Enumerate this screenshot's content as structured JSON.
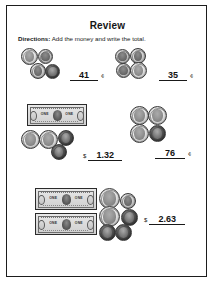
{
  "worksheet": {
    "title": "Review",
    "directions_label": "Directions:",
    "directions_text": " Add the money and write the total."
  },
  "problems": [
    {
      "id": "problem-1",
      "position": "row1-left",
      "currency_symbol": "",
      "answer": "41",
      "unit": "¢",
      "bills": 0,
      "coins": 4
    },
    {
      "id": "problem-2",
      "position": "row1-right",
      "currency_symbol": "",
      "answer": "35",
      "unit": "¢",
      "bills": 0,
      "coins": 4
    },
    {
      "id": "problem-3",
      "position": "row2-left",
      "currency_symbol": "$",
      "answer": "1.32",
      "unit": "",
      "bills": 1,
      "coins": 4
    },
    {
      "id": "problem-4",
      "position": "row2-right",
      "currency_symbol": "",
      "answer": "76",
      "unit": "¢",
      "bills": 0,
      "coins": 4
    },
    {
      "id": "problem-5",
      "position": "row3",
      "currency_symbol": "$",
      "answer": "2.63",
      "unit": "",
      "bills": 2,
      "coins": 6
    }
  ],
  "bill_labels": {
    "left": "ONE",
    "right": "ONE"
  },
  "colors": {
    "ink": "#161616",
    "frame": "#1d1d1d",
    "paper": "#ffffff"
  }
}
